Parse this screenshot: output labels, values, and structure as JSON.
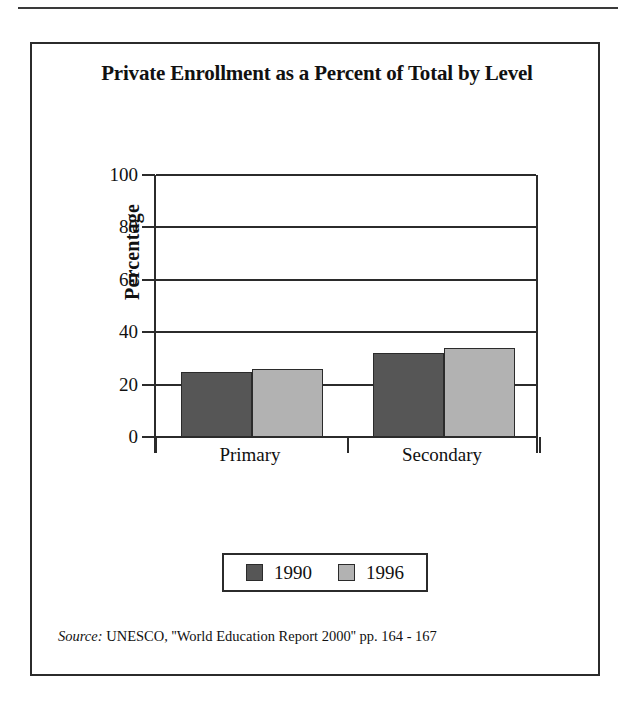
{
  "figure": {
    "title": "Private Enrollment as a Percent of Total by Level",
    "source_label": "Source:",
    "source_text": " UNESCO, ''World Education Report 2000'' pp. 164 - 167"
  },
  "chart_data": {
    "type": "bar",
    "title": "Private Enrollment as a Percent of Total by Level",
    "xlabel": "",
    "ylabel": "Percentage",
    "ylim": [
      0,
      100
    ],
    "yticks": [
      0,
      20,
      40,
      60,
      80,
      100
    ],
    "ytick_labels": [
      "0",
      "20",
      "40",
      "60",
      "80",
      "100"
    ],
    "grid": true,
    "legend_position": "bottom",
    "categories": [
      "Primary",
      "Secondary"
    ],
    "series": [
      {
        "name": "1990",
        "color": "#565656",
        "values": [
          25,
          32
        ]
      },
      {
        "name": "1996",
        "color": "#b2b2b2",
        "values": [
          26,
          34
        ]
      }
    ]
  },
  "colors": {
    "series_1990": "#565656",
    "series_1996": "#b2b2b2",
    "axis": "#2b2b2b",
    "background": "#ffffff"
  }
}
